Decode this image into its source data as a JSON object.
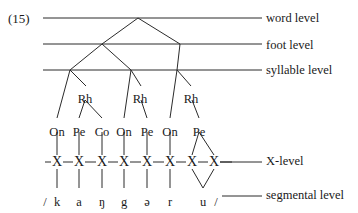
{
  "figure": {
    "example_number": "(15)",
    "transcription_open": "/",
    "transcription_close": "/"
  },
  "level_labels": {
    "word": "word level",
    "foot": "foot level",
    "syllable": "syllable level",
    "x": "X-level",
    "segmental": "segmental level"
  },
  "constituent_labels": {
    "rhyme": "Rh",
    "onset": "On",
    "peak": "Pe",
    "coda": "Co"
  },
  "rhyme_nodes": [
    {
      "id": "rh-1",
      "label": "Rh",
      "x": 85,
      "y": 93
    },
    {
      "id": "rh-2",
      "label": "Rh",
      "x": 140,
      "y": 93
    },
    {
      "id": "rh-3",
      "label": "Rh",
      "x": 191,
      "y": 93
    }
  ],
  "constituent_row": [
    {
      "id": "on-1",
      "label": "On",
      "x": 57,
      "y": 126
    },
    {
      "id": "pe-1",
      "label": "Pe",
      "x": 79,
      "y": 126
    },
    {
      "id": "co-1",
      "label": "Co",
      "x": 102,
      "y": 126
    },
    {
      "id": "on-2",
      "label": "On",
      "x": 124,
      "y": 126
    },
    {
      "id": "pe-2",
      "label": "Pe",
      "x": 147,
      "y": 126
    },
    {
      "id": "on-3",
      "label": "On",
      "x": 170,
      "y": 126
    },
    {
      "id": "pe-3",
      "label": "Pe",
      "x": 199,
      "y": 126
    }
  ],
  "x_slots": [
    {
      "id": "x-1",
      "label": "X",
      "x": 57
    },
    {
      "id": "x-2",
      "label": "X",
      "x": 79
    },
    {
      "id": "x-3",
      "label": "X",
      "x": 102
    },
    {
      "id": "x-4",
      "label": "X",
      "x": 124
    },
    {
      "id": "x-5",
      "label": "X",
      "x": 147
    },
    {
      "id": "x-6",
      "label": "X",
      "x": 170
    },
    {
      "id": "x-7",
      "label": "X",
      "x": 192
    },
    {
      "id": "x-8",
      "label": "X",
      "x": 214
    }
  ],
  "x_row_y": 162,
  "segments": [
    {
      "id": "seg-k",
      "label": "k",
      "x": 57,
      "y": 196
    },
    {
      "id": "seg-a",
      "label": "a",
      "x": 79,
      "y": 196
    },
    {
      "id": "seg-ng",
      "label": "ŋ",
      "x": 102,
      "y": 196
    },
    {
      "id": "seg-g",
      "label": "g",
      "x": 124,
      "y": 196
    },
    {
      "id": "seg-schwa",
      "label": "ə",
      "x": 147,
      "y": 196
    },
    {
      "id": "seg-r",
      "label": "r",
      "x": 170,
      "y": 196
    },
    {
      "id": "seg-u",
      "label": "u",
      "x": 203,
      "y": 196
    }
  ],
  "transcription_marks": [
    {
      "id": "slash-open",
      "label": "/",
      "x": 45,
      "y": 196
    },
    {
      "id": "slash-close",
      "label": "/",
      "x": 216,
      "y": 196
    }
  ],
  "tree_nodes": {
    "word": {
      "x": 138,
      "y": 18
    },
    "foot_left": {
      "x": 102,
      "y": 44
    },
    "foot_right": {
      "x": 180,
      "y": 44
    },
    "syllable_1": {
      "x": 70,
      "y": 70
    },
    "syllable_2": {
      "x": 131,
      "y": 70
    },
    "syllable_3": {
      "x": 177,
      "y": 70
    }
  },
  "level_lines": {
    "x_start": 43,
    "x_end": 262,
    "word_y": 18,
    "foot_y": 44,
    "syllable_y": 70,
    "x_level_y": 162,
    "segmental_y": 196
  },
  "colors": {
    "ink": "#1a1a1a",
    "line": "#2b2b2b",
    "background": "#ffffff"
  }
}
